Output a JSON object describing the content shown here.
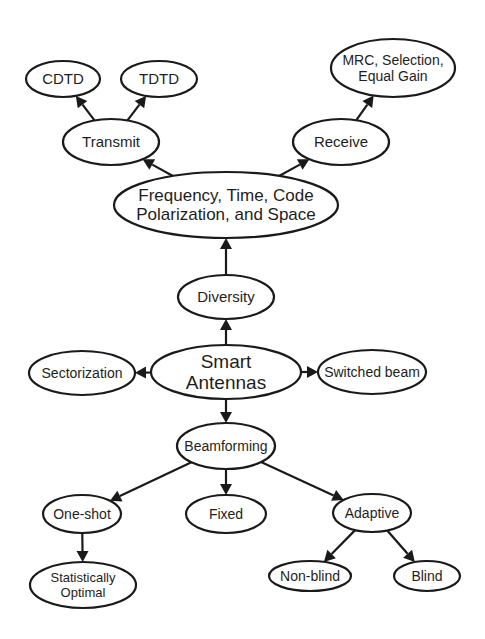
{
  "diagram": {
    "colors": {
      "stroke": "#1a1a1a",
      "fill": "#ffffff",
      "text": "#1e1e1e"
    },
    "nodes": [
      {
        "id": "cdtd",
        "lines": [
          "CDTD"
        ],
        "cx": 63,
        "cy": 79,
        "rx": 37,
        "ry": 18,
        "fs": 15
      },
      {
        "id": "tdtd",
        "lines": [
          "TDTD"
        ],
        "cx": 159,
        "cy": 79,
        "rx": 38,
        "ry": 18,
        "fs": 15
      },
      {
        "id": "transmit",
        "lines": [
          "Transmit"
        ],
        "cx": 111,
        "cy": 142,
        "rx": 48,
        "ry": 23,
        "fs": 15
      },
      {
        "id": "mrc",
        "lines": [
          "MRC, Selection,",
          "Equal Gain"
        ],
        "cx": 393,
        "cy": 68,
        "rx": 62,
        "ry": 29,
        "fs": 14
      },
      {
        "id": "receive",
        "lines": [
          "Receive"
        ],
        "cx": 341,
        "cy": 142,
        "rx": 48,
        "ry": 23,
        "fs": 15
      },
      {
        "id": "freq",
        "lines": [
          "Frequency, Time, Code",
          "Polarization, and Space"
        ],
        "cx": 226,
        "cy": 205,
        "rx": 112,
        "ry": 33,
        "fs": 17
      },
      {
        "id": "diversity",
        "lines": [
          "Diversity"
        ],
        "cx": 226,
        "cy": 297,
        "rx": 48,
        "ry": 22,
        "fs": 15
      },
      {
        "id": "smart",
        "lines": [
          "Smart",
          "Antennas"
        ],
        "cx": 226,
        "cy": 372,
        "rx": 75,
        "ry": 27,
        "fs": 19
      },
      {
        "id": "sectorization",
        "lines": [
          "Sectorization"
        ],
        "cx": 82,
        "cy": 373,
        "rx": 53,
        "ry": 22,
        "fs": 14
      },
      {
        "id": "switched",
        "lines": [
          "Switched beam"
        ],
        "cx": 372,
        "cy": 372,
        "rx": 54,
        "ry": 22,
        "fs": 14
      },
      {
        "id": "beamforming",
        "lines": [
          "Beamforming"
        ],
        "cx": 226,
        "cy": 446,
        "rx": 49,
        "ry": 23,
        "fs": 14
      },
      {
        "id": "oneshot",
        "lines": [
          "One-shot"
        ],
        "cx": 82,
        "cy": 514,
        "rx": 39,
        "ry": 19,
        "fs": 14
      },
      {
        "id": "fixed",
        "lines": [
          "Fixed"
        ],
        "cx": 226,
        "cy": 514,
        "rx": 40,
        "ry": 19,
        "fs": 14
      },
      {
        "id": "adaptive",
        "lines": [
          "Adaptive"
        ],
        "cx": 372,
        "cy": 513,
        "rx": 39,
        "ry": 19,
        "fs": 14
      },
      {
        "id": "statistically",
        "lines": [
          "Statistically",
          "Optimal"
        ],
        "cx": 83,
        "cy": 585,
        "rx": 53,
        "ry": 23,
        "fs": 13
      },
      {
        "id": "nonblind",
        "lines": [
          "Non-blind"
        ],
        "cx": 310,
        "cy": 576,
        "rx": 41,
        "ry": 15,
        "fs": 14
      },
      {
        "id": "blind",
        "lines": [
          "Blind"
        ],
        "cx": 427,
        "cy": 576,
        "rx": 33,
        "ry": 15,
        "fs": 14
      }
    ],
    "edges": [
      {
        "from": "smart",
        "to": "diversity"
      },
      {
        "from": "smart",
        "to": "sectorization"
      },
      {
        "from": "smart",
        "to": "switched"
      },
      {
        "from": "smart",
        "to": "beamforming"
      },
      {
        "from": "diversity",
        "to": "freq"
      },
      {
        "from": "freq",
        "to": "transmit"
      },
      {
        "from": "freq",
        "to": "receive"
      },
      {
        "from": "transmit",
        "to": "cdtd"
      },
      {
        "from": "transmit",
        "to": "tdtd"
      },
      {
        "from": "receive",
        "to": "mrc"
      },
      {
        "from": "beamforming",
        "to": "oneshot"
      },
      {
        "from": "beamforming",
        "to": "fixed"
      },
      {
        "from": "beamforming",
        "to": "adaptive"
      },
      {
        "from": "oneshot",
        "to": "statistically"
      },
      {
        "from": "adaptive",
        "to": "nonblind"
      },
      {
        "from": "adaptive",
        "to": "blind"
      }
    ]
  }
}
